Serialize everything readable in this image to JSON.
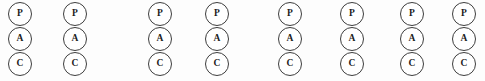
{
  "figure": {
    "name": "pac-node-row",
    "background_color": "#fdfdfd",
    "outline_color": "#3d3d3d",
    "text_color": "#1c1c1c",
    "node_diameter_px": 24,
    "column_count": 8,
    "nodes_per_column": 3
  },
  "labels": {
    "top": "P",
    "middle": "A",
    "bottom": "C"
  },
  "columns": [
    {
      "index": 1,
      "x": 8,
      "nodes": [
        {
          "slot": "p",
          "label": "P"
        },
        {
          "slot": "a",
          "label": "A"
        },
        {
          "slot": "c",
          "label": "C"
        }
      ]
    },
    {
      "index": 2,
      "x": 63,
      "nodes": [
        {
          "slot": "p",
          "label": "P"
        },
        {
          "slot": "a",
          "label": "A"
        },
        {
          "slot": "c",
          "label": "C"
        }
      ]
    },
    {
      "index": 3,
      "x": 148,
      "nodes": [
        {
          "slot": "p",
          "label": "P"
        },
        {
          "slot": "a",
          "label": "A"
        },
        {
          "slot": "c",
          "label": "C"
        }
      ]
    },
    {
      "index": 4,
      "x": 205,
      "nodes": [
        {
          "slot": "p",
          "label": "P"
        },
        {
          "slot": "a",
          "label": "A"
        },
        {
          "slot": "c",
          "label": "C"
        }
      ]
    },
    {
      "index": 5,
      "x": 278,
      "nodes": [
        {
          "slot": "p",
          "label": "P"
        },
        {
          "slot": "a",
          "label": "A"
        },
        {
          "slot": "c",
          "label": "C"
        }
      ]
    },
    {
      "index": 6,
      "x": 340,
      "nodes": [
        {
          "slot": "p",
          "label": "P"
        },
        {
          "slot": "a",
          "label": "A"
        },
        {
          "slot": "c",
          "label": "C"
        }
      ]
    },
    {
      "index": 7,
      "x": 400,
      "nodes": [
        {
          "slot": "p",
          "label": "P"
        },
        {
          "slot": "a",
          "label": "A"
        },
        {
          "slot": "c",
          "label": "C"
        }
      ]
    },
    {
      "index": 8,
      "x": 452,
      "nodes": [
        {
          "slot": "p",
          "label": "P"
        },
        {
          "slot": "a",
          "label": "A"
        },
        {
          "slot": "c",
          "label": "C"
        }
      ]
    }
  ]
}
